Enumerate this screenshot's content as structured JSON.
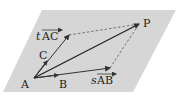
{
  "diagram": {
    "plane_color": "#d6d6d6",
    "line_color": "#333333",
    "dash_color": "#555555",
    "points": {
      "A": {
        "label": "A",
        "x": 34,
        "y": 78
      },
      "B": {
        "label": "B",
        "x": 57,
        "y": 76
      },
      "C": {
        "label": "C",
        "x": 46,
        "y": 60
      },
      "P": {
        "label": "P",
        "x": 139,
        "y": 24
      }
    },
    "vectors": [
      {
        "name": "tAC",
        "scalar": "t",
        "label": "AC"
      },
      {
        "name": "sAB",
        "scalar": "s",
        "label": "AB"
      },
      {
        "name": "AP",
        "label": "AP"
      }
    ],
    "labels": {
      "A": "A",
      "B": "B",
      "C": "C",
      "P": "P",
      "t": "t",
      "s": "s",
      "AC": "AC",
      "AB": "AB"
    }
  }
}
